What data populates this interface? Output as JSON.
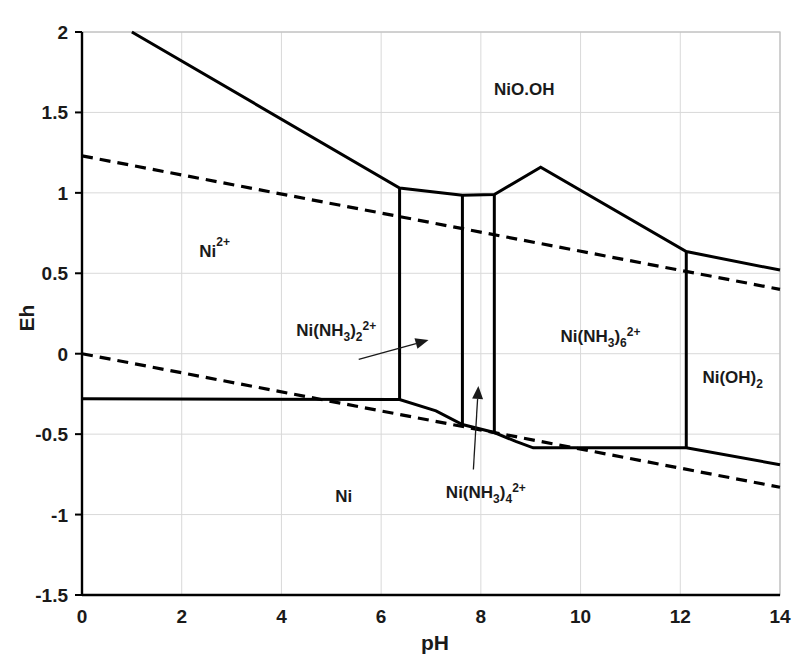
{
  "chart_data": {
    "type": "line",
    "title": "",
    "xlabel": "pH",
    "ylabel": "Eh",
    "xlim": [
      0,
      14
    ],
    "ylim": [
      -1.5,
      2
    ],
    "xticks": [
      "0",
      "2",
      "4",
      "6",
      "8",
      "10",
      "12",
      "14"
    ],
    "xtick_values": [
      0,
      2,
      4,
      6,
      8,
      10,
      12,
      14
    ],
    "yticks": [
      "-1.5",
      "-1",
      "-0.5",
      "0",
      "0.5",
      "1",
      "1.5",
      "2"
    ],
    "ytick_values": [
      -1.5,
      -1,
      -0.5,
      0,
      0.5,
      1,
      1.5,
      2
    ],
    "grid": true,
    "legend": "none",
    "series": [
      {
        "name": "upper-stability-boundary",
        "style": "solid",
        "points": [
          [
            1.0,
            2.0
          ],
          [
            6.37,
            1.03
          ],
          [
            7.63,
            0.985
          ],
          [
            8.27,
            0.99
          ],
          [
            9.2,
            1.16
          ],
          [
            12.12,
            0.635
          ],
          [
            14.0,
            0.52
          ]
        ]
      },
      {
        "name": "vertical-Ni(NH3)2-left",
        "style": "solid",
        "points": [
          [
            6.37,
            1.03
          ],
          [
            6.37,
            -0.285
          ]
        ]
      },
      {
        "name": "vertical-Ni(NH3)2-right",
        "style": "solid",
        "points": [
          [
            7.63,
            0.985
          ],
          [
            7.63,
            -0.44
          ]
        ]
      },
      {
        "name": "vertical-Ni(NH3)4-right",
        "style": "solid",
        "points": [
          [
            8.27,
            0.99
          ],
          [
            8.27,
            -0.49
          ]
        ]
      },
      {
        "name": "vertical-Ni(OH)2-left",
        "style": "solid",
        "points": [
          [
            12.12,
            0.635
          ],
          [
            12.12,
            -0.585
          ]
        ]
      },
      {
        "name": "lower-metal-boundary",
        "style": "solid",
        "points": [
          [
            0.0,
            -0.28
          ],
          [
            6.37,
            -0.285
          ],
          [
            7.1,
            -0.355
          ],
          [
            7.63,
            -0.44
          ],
          [
            8.27,
            -0.49
          ],
          [
            8.7,
            -0.545
          ],
          [
            9.05,
            -0.585
          ],
          [
            12.12,
            -0.585
          ],
          [
            14.0,
            -0.69
          ]
        ]
      },
      {
        "name": "water-oxidation-line",
        "style": "dashed",
        "points": [
          [
            0.0,
            1.23
          ],
          [
            14.0,
            0.4
          ]
        ]
      },
      {
        "name": "water-reduction-line",
        "style": "dashed",
        "points": [
          [
            0.0,
            0.0
          ],
          [
            14.0,
            -0.83
          ]
        ]
      }
    ],
    "annotations": [
      {
        "name": "NiO.OH",
        "text_parts": {
          "base": "NiO.OH",
          "sub": "",
          "sup": ""
        },
        "x": 8.87,
        "y": 1.61,
        "anchor": "middle"
      },
      {
        "name": "Ni2+",
        "text_parts": {
          "base": "Ni",
          "sub": "",
          "sup": "2+"
        },
        "x": 2.66,
        "y": 0.6,
        "anchor": "middle"
      },
      {
        "name": "Ni",
        "text_parts": {
          "base": "Ni",
          "sub": "",
          "sup": ""
        },
        "x": 5.25,
        "y": -0.92,
        "anchor": "middle"
      },
      {
        "name": "Ni(NH3)2_2+",
        "text_parts": {
          "base": "Ni(NH",
          "sub": "3",
          "mid": ")",
          "sub2": "2",
          "sup": "2+"
        },
        "x": 5.1,
        "y": 0.11,
        "anchor": "middle"
      },
      {
        "name": "Ni(NH3)4_2+",
        "text_parts": {
          "base": "Ni(NH",
          "sub": "3",
          "mid": ")",
          "sub2": "4",
          "sup": "2+"
        },
        "x": 8.1,
        "y": -0.9,
        "anchor": "middle"
      },
      {
        "name": "Ni(NH3)6_2+",
        "text_parts": {
          "base": "Ni(NH",
          "sub": "3",
          "mid": ")",
          "sub2": "6",
          "sup": "2+"
        },
        "x": 10.4,
        "y": 0.07,
        "anchor": "middle"
      },
      {
        "name": "Ni(OH)2",
        "text_parts": {
          "base": "Ni(OH)",
          "sub": "2",
          "sup": ""
        },
        "x": 13.05,
        "y": -0.18,
        "anchor": "middle"
      }
    ],
    "leaders": [
      {
        "name": "leader-Ni(NH3)2",
        "from": [
          5.55,
          -0.035
        ],
        "to": [
          6.95,
          0.085
        ]
      },
      {
        "name": "leader-Ni(NH3)4",
        "from": [
          7.85,
          -0.72
        ],
        "to": [
          7.95,
          -0.2
        ]
      }
    ]
  }
}
